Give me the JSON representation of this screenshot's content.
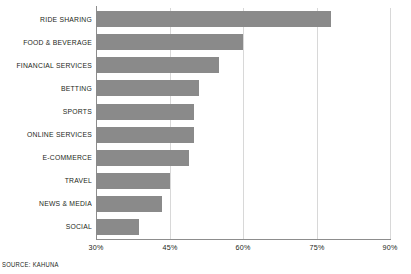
{
  "chart_data": {
    "type": "bar",
    "orientation": "horizontal",
    "title": "",
    "xlabel": "",
    "ylabel": "",
    "xlim": [
      30,
      90
    ],
    "xticks": [
      "30%",
      "45%",
      "60%",
      "75%",
      "90%"
    ],
    "xtick_values": [
      30,
      45,
      60,
      75,
      90
    ],
    "grid": "vertical",
    "legend": "none",
    "bar_color": "#8a8a8a",
    "categories": [
      "RIDE SHARING",
      "FOOD & BEVERAGE",
      "FINANCIAL SERVICES",
      "BETTING",
      "SPORTS",
      "ONLINE SERVICES",
      "E-COMMERCE",
      "TRAVEL",
      "NEWS & MEDIA",
      "SOCIAL"
    ],
    "values": [
      78,
      60,
      55,
      51,
      50,
      50,
      49,
      45,
      43.5,
      38.8
    ],
    "source": "SOURCE: KAHUNA"
  },
  "colors": {
    "bar": "#8a8a8a",
    "axis": "#8d8d8d",
    "grid": "#d8d8d8",
    "text": "#231f20",
    "background": "#ffffff"
  }
}
